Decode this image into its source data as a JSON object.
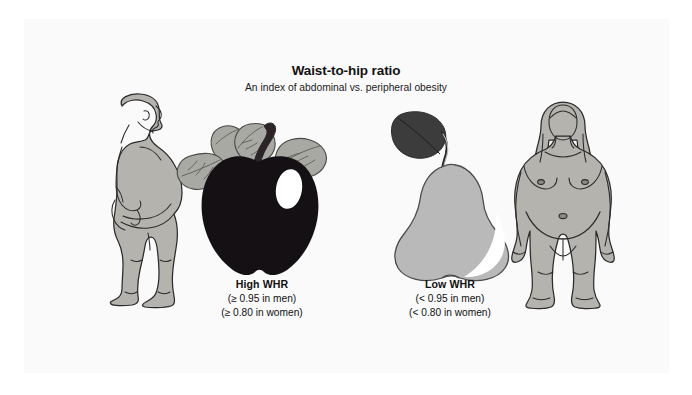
{
  "figure": {
    "title": "Waist-to-hip ratio",
    "subtitle": "An index of abdominal vs. peripheral obesity"
  },
  "captions": {
    "high": {
      "title": "High WHR",
      "men": "(≥ 0.95 in men)",
      "women": "(≥ 0.80 in women)"
    },
    "low": {
      "title": "Low WHR",
      "men": "(< 0.95 in men)",
      "women": "(< 0.80 in women)"
    }
  },
  "illustrations": {
    "male_figure": "obese-male-side-profile",
    "apple": "dark-apple-with-leaves",
    "pear": "light-pear-with-leaf",
    "female_figure": "obese-female-front-view"
  },
  "colors": {
    "page_background": "#fafafa",
    "canvas_background": "#ffffff",
    "body_fill": "#b5b3ad",
    "body_outline": "#2b2b2b",
    "apple_fill": "#141013",
    "apple_highlight": "#ffffff",
    "leaf_fill": "#a9a9a4",
    "leaf_vein": "#5e5e5a",
    "pear_fill": "#b9b9b9",
    "pear_highlight": "#ffffff",
    "pear_leaf_fill": "#3c3c3c",
    "text": "#111111"
  }
}
